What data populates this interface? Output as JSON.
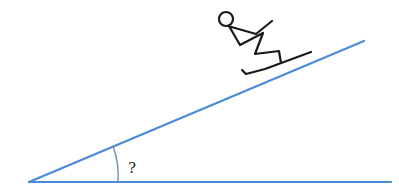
{
  "diagram": {
    "type": "inclined-plane",
    "angle_label": "?",
    "colors": {
      "lines": "#4a8ad8",
      "arc": "#6a8cb8",
      "figure": "#1a1a1a",
      "background": "#ffffff"
    },
    "elements": [
      {
        "name": "ground-line",
        "description": "horizontal base line"
      },
      {
        "name": "slope-line",
        "description": "inclined line rising to the right"
      },
      {
        "name": "angle-arc",
        "description": "arc marking unknown angle at apex"
      },
      {
        "name": "skier",
        "description": "stick-figure skier descending the slope"
      }
    ]
  }
}
